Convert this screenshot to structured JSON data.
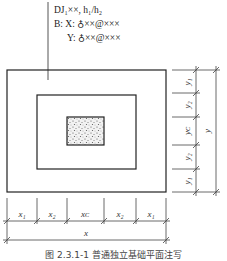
{
  "annotation": {
    "line1": "DJ₁××, h₁/h₂",
    "line2": "B: X: ♁××@×××",
    "line3": "Y: ♁××@×××"
  },
  "dimensions": {
    "bottom": {
      "segments": [
        "x₁",
        "x₂",
        "xᴄ",
        "x₂",
        "x₁"
      ],
      "total": "x"
    },
    "right": {
      "segments": [
        "y₁",
        "y₂",
        "yᴄ",
        "y₂",
        "y₁"
      ],
      "total": "y"
    }
  },
  "caption": "图 2.3.1-1  普通独立基础平面注写"
}
